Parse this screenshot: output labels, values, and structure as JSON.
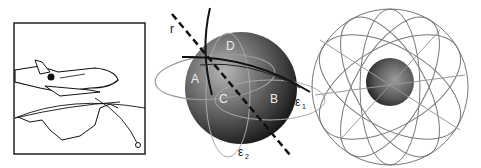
{
  "panels": [
    {
      "id": "airplane",
      "description": "Line drawing of jet airplane over globe with flight route"
    },
    {
      "id": "sphere",
      "description": "Shaded sphere with orbital paths and labeled points",
      "labels": {
        "r": "r",
        "A": "A",
        "B": "B",
        "C": "C",
        "D": "D",
        "e1": "ε",
        "e1_sub": "1",
        "e2": "ε",
        "e2_sub": "2"
      }
    },
    {
      "id": "constellation",
      "description": "Earth surrounded by satellite orbit rings"
    }
  ],
  "colors": {
    "ink": "#111111",
    "sphere_light": "#9a9a9a",
    "sphere_dark": "#1a1a1a",
    "orbit": "#777777",
    "frame": "#222222"
  }
}
